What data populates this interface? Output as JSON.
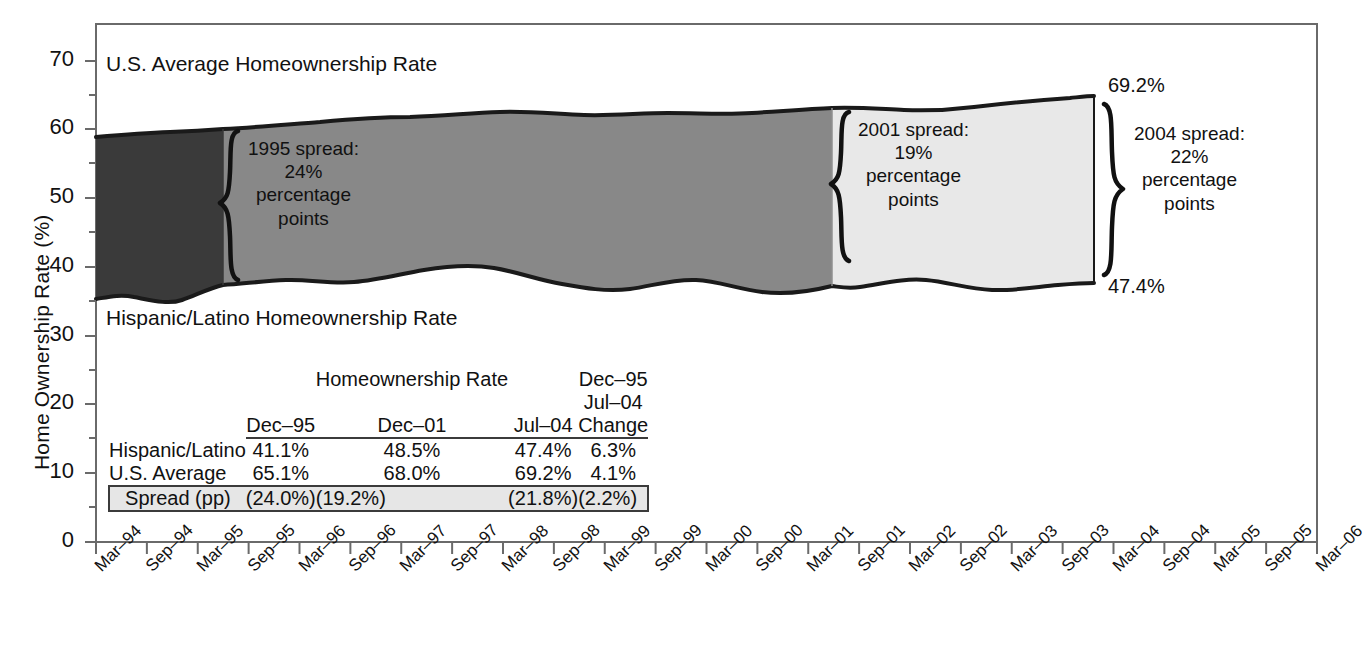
{
  "axes": {
    "y_title": "Home Ownership Rate (%)",
    "y_ticks": [
      "0",
      "10",
      "20",
      "30",
      "40",
      "50",
      "60",
      "70"
    ],
    "y_tick_values": [
      0,
      10,
      20,
      30,
      40,
      50,
      60,
      70
    ],
    "y_minor_values": [
      5,
      15,
      25,
      35,
      45,
      55,
      65
    ],
    "ylim": [
      0,
      75
    ],
    "x_ticks": [
      "Mar–94",
      "Sep–94",
      "Mar–95",
      "Sep–95",
      "Mar–96",
      "Sep–96",
      "Mar–97",
      "Sep–97",
      "Mar–98",
      "Sep–98",
      "Mar–99",
      "Sep–99",
      "Mar–00",
      "Sep–00",
      "Mar–01",
      "Sep–01",
      "Mar–02",
      "Sep–02",
      "Mar–03",
      "Sep–03",
      "Mar–04",
      "Sep–04",
      "Mar–05",
      "Sep–05",
      "Mar–06"
    ]
  },
  "series_labels": {
    "upper": "U.S. Average Homeownership Rate",
    "lower": "Hispanic/Latino Homeownership Rate"
  },
  "annotations": {
    "spread1995": {
      "line1": "1995 spread:",
      "line2": "24%",
      "line3": "percentage",
      "line4": "points"
    },
    "spread2001": {
      "line1": "2001 spread:",
      "line2": "19%",
      "line3": "percentage",
      "line4": "points"
    },
    "spread2004": {
      "line1": "2004 spread:",
      "line2": "22%",
      "line3": "percentage",
      "line4": "points"
    },
    "end_upper": "69.2%",
    "end_lower": "47.4%"
  },
  "table": {
    "group_header": "Homeownership Rate",
    "columns": [
      "Dec–95",
      "Dec–01",
      "Jul–04",
      "Dec–95\nJul–04\nChange"
    ],
    "col_labels": [
      {
        "top": "",
        "mid": "",
        "bot": "Dec–95"
      },
      {
        "top": "",
        "mid": "",
        "bot": "Dec–01"
      },
      {
        "top": "",
        "mid": "",
        "bot": "Jul–04"
      },
      {
        "top": "Dec–95",
        "mid": "Jul–04",
        "bot": "Change"
      }
    ],
    "rows": [
      {
        "name": "Hispanic/Latino",
        "values": [
          "41.1%",
          "48.5%",
          "47.4%",
          "6.3%"
        ]
      },
      {
        "name": "U.S. Average",
        "values": [
          "65.1%",
          "68.0%",
          "69.2%",
          "4.1%"
        ]
      }
    ],
    "spread_row": {
      "name": "Spread (pp)",
      "values": [
        "(24.0%)",
        "(19.2%)",
        "(21.8%)",
        "(2.2%)"
      ]
    }
  },
  "colors": {
    "band_dark": "#3a3a3a",
    "band_medium": "#888888",
    "band_light": "#e8e8e8",
    "outline": "#1a1a1a",
    "axis": "#6a6a6a",
    "table_rule": "#3b3b3b",
    "spread_fill": "#e6e6e6"
  },
  "chart_data": {
    "type": "area",
    "title": "",
    "xlabel": "",
    "ylabel": "Home Ownership Rate (%)",
    "ylim": [
      0,
      75
    ],
    "grid": false,
    "legend": "in-plot labels",
    "x": [
      "Mar–94",
      "Sep–94",
      "Mar–95",
      "Sep–95",
      "Mar–96",
      "Sep–96",
      "Mar–97",
      "Sep–97",
      "Mar–98",
      "Sep–98",
      "Mar–99",
      "Sep–99",
      "Mar–00",
      "Sep–00",
      "Mar–01",
      "Sep–01",
      "Mar–02",
      "Sep–02",
      "Mar–03",
      "Sep–03",
      "Mar–04",
      "Sep–04",
      "Mar–05",
      "Sep–05",
      "Mar–06"
    ],
    "series": [
      {
        "name": "U.S. Average Homeownership Rate",
        "values": [
          64.0,
          64.2,
          64.3,
          65.1,
          65.1,
          65.4,
          65.5,
          65.7,
          66.0,
          66.8,
          66.8,
          66.9,
          67.1,
          67.4,
          67.5,
          68.0,
          67.8,
          68.0,
          68.2,
          68.4,
          69.2,
          69.2,
          69.2,
          69.2,
          69.2
        ]
      },
      {
        "name": "Hispanic/Latino Homeownership Rate",
        "values": [
          39.0,
          40.0,
          39.6,
          41.1,
          41.4,
          42.3,
          42.8,
          43.2,
          44.7,
          45.0,
          45.5,
          45.7,
          46.3,
          46.3,
          47.3,
          48.5,
          47.1,
          47.8,
          46.7,
          46.9,
          47.4,
          47.4,
          47.4,
          47.4,
          47.4
        ]
      }
    ],
    "annotated_points": [
      {
        "label": "Dec–95 spread",
        "value": 24.0,
        "display": "24% percentage points"
      },
      {
        "label": "Dec–01 spread",
        "value": 19.2,
        "display": "19% percentage points"
      },
      {
        "label": "Jul–04 spread",
        "value": 21.8,
        "display": "22% percentage points"
      },
      {
        "label": "Jul–04 U.S. Average",
        "value": 69.2,
        "display": "69.2%"
      },
      {
        "label": "Jul–04 Hispanic/Latino",
        "value": 47.4,
        "display": "47.4%"
      }
    ],
    "shaded_segments": [
      {
        "from": "Mar–94",
        "to": "Dec–95",
        "shade": "dark"
      },
      {
        "from": "Dec–95",
        "to": "Dec–01",
        "shade": "medium"
      },
      {
        "from": "Dec–01",
        "to": "Jul–04",
        "shade": "light"
      }
    ]
  }
}
